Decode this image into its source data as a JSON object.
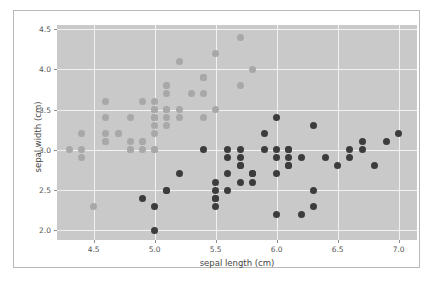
{
  "chart_data": {
    "type": "scatter",
    "title": "",
    "xlabel": "sepal length (cm)",
    "ylabel": "sepal width (cm)",
    "xlim": [
      4.2,
      7.15
    ],
    "ylim": [
      1.88,
      4.55
    ],
    "xticks": [
      "4.5",
      "5.0",
      "5.5",
      "6.0",
      "6.5",
      "7.0"
    ],
    "xtick_values": [
      4.5,
      5.0,
      5.5,
      6.0,
      6.5,
      7.0
    ],
    "yticks": [
      "2.0",
      "2.5",
      "3.0",
      "3.5",
      "4.0",
      "4.5"
    ],
    "ytick_values": [
      2.0,
      2.5,
      3.0,
      3.5,
      4.0,
      4.5
    ],
    "grid": true,
    "legend": "none",
    "background": "#c9c9c9",
    "gridcolor": "#f2f2f2",
    "series": [
      {
        "name": "setosa",
        "color": "#a8a8a8",
        "points": [
          [
            4.3,
            3.0
          ],
          [
            4.4,
            2.9
          ],
          [
            4.4,
            3.0
          ],
          [
            4.4,
            3.2
          ],
          [
            4.5,
            2.3
          ],
          [
            4.6,
            3.1
          ],
          [
            4.6,
            3.4
          ],
          [
            4.6,
            3.6
          ],
          [
            4.6,
            3.2
          ],
          [
            4.7,
            3.2
          ],
          [
            4.8,
            3.0
          ],
          [
            4.8,
            3.4
          ],
          [
            4.8,
            3.1
          ],
          [
            4.9,
            3.0
          ],
          [
            4.9,
            3.1
          ],
          [
            4.9,
            3.6
          ],
          [
            5.0,
            3.0
          ],
          [
            5.0,
            3.2
          ],
          [
            5.0,
            3.3
          ],
          [
            5.0,
            3.4
          ],
          [
            5.0,
            3.5
          ],
          [
            5.0,
            3.6
          ],
          [
            5.1,
            3.3
          ],
          [
            5.1,
            3.4
          ],
          [
            5.1,
            3.5
          ],
          [
            5.1,
            3.7
          ],
          [
            5.1,
            3.8
          ],
          [
            5.1,
            3.8
          ],
          [
            5.2,
            3.4
          ],
          [
            5.2,
            3.5
          ],
          [
            5.2,
            4.1
          ],
          [
            5.3,
            3.7
          ],
          [
            5.4,
            3.4
          ],
          [
            5.4,
            3.7
          ],
          [
            5.4,
            3.9
          ],
          [
            5.4,
            3.9
          ],
          [
            5.5,
            3.5
          ],
          [
            5.5,
            4.2
          ],
          [
            5.7,
            3.8
          ],
          [
            5.7,
            4.4
          ],
          [
            5.8,
            4.0
          ],
          [
            5.0,
            3.0
          ],
          [
            5.0,
            3.5
          ],
          [
            4.7,
            3.2
          ],
          [
            4.9,
            3.1
          ],
          [
            5.1,
            3.5
          ],
          [
            4.6,
            3.1
          ],
          [
            5.4,
            3.9
          ],
          [
            5.0,
            3.4
          ],
          [
            4.8,
            3.0
          ]
        ]
      },
      {
        "name": "versicolor",
        "color": "#3c3c3c",
        "points": [
          [
            5.0,
            2.0
          ],
          [
            5.0,
            2.3
          ],
          [
            4.9,
            2.4
          ],
          [
            5.1,
            2.5
          ],
          [
            5.5,
            2.3
          ],
          [
            5.5,
            2.4
          ],
          [
            5.5,
            2.4
          ],
          [
            5.5,
            2.5
          ],
          [
            5.5,
            2.6
          ],
          [
            5.6,
            2.5
          ],
          [
            5.6,
            2.7
          ],
          [
            5.6,
            2.9
          ],
          [
            5.6,
            3.0
          ],
          [
            5.7,
            2.6
          ],
          [
            5.7,
            2.8
          ],
          [
            5.7,
            2.9
          ],
          [
            5.7,
            3.0
          ],
          [
            5.8,
            2.6
          ],
          [
            5.8,
            2.7
          ],
          [
            5.9,
            3.0
          ],
          [
            5.9,
            3.2
          ],
          [
            6.0,
            2.2
          ],
          [
            6.0,
            2.7
          ],
          [
            6.0,
            2.9
          ],
          [
            6.0,
            3.4
          ],
          [
            6.1,
            2.8
          ],
          [
            6.1,
            2.8
          ],
          [
            6.1,
            2.9
          ],
          [
            6.1,
            3.0
          ],
          [
            6.2,
            2.2
          ],
          [
            6.2,
            2.9
          ],
          [
            6.3,
            2.3
          ],
          [
            6.3,
            2.5
          ],
          [
            6.3,
            3.3
          ],
          [
            6.4,
            2.9
          ],
          [
            6.5,
            2.8
          ],
          [
            6.6,
            2.9
          ],
          [
            6.6,
            3.0
          ],
          [
            6.7,
            3.0
          ],
          [
            6.7,
            3.1
          ],
          [
            6.8,
            2.8
          ],
          [
            6.9,
            3.1
          ],
          [
            7.0,
            3.2
          ],
          [
            5.4,
            3.0
          ],
          [
            5.2,
            2.7
          ],
          [
            5.1,
            2.5
          ],
          [
            6.1,
            3.0
          ],
          [
            5.7,
            2.8
          ],
          [
            6.0,
            3.0
          ],
          [
            5.8,
            2.7
          ]
        ]
      }
    ]
  }
}
